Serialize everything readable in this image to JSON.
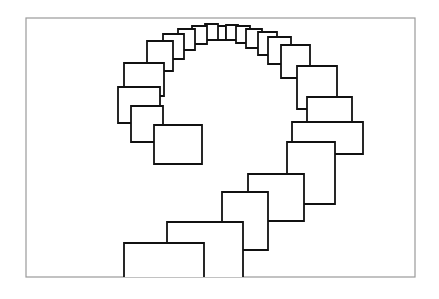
{
  "figure": {
    "caption": "",
    "background_color": "#ffffff",
    "stroke_color": "#111111",
    "fill_color": "#ffffff",
    "frame_color": "#9a9a9a",
    "frame": {
      "x": 26,
      "y": 18,
      "width": 389,
      "height": 259,
      "stroke_width": 1.2
    },
    "canvas": {
      "width": 439,
      "height": 299
    }
  },
  "chart_data": {
    "type": "diagram",
    "xlabel": "",
    "ylabel": "",
    "grid": false,
    "legend": "none",
    "xlim": [
      0,
      439
    ],
    "ylim": [
      0,
      299
    ],
    "shape": "rectangle",
    "count": 22,
    "stroke_width_px": 1.8,
    "rectangles": [
      {
        "index": 1,
        "x": 215,
        "y": 26,
        "width": 11,
        "height": 14,
        "clip_bottom": false
      },
      {
        "index": 2,
        "x": 226,
        "y": 25,
        "width": 12,
        "height": 15,
        "clip_bottom": false
      },
      {
        "index": 3,
        "x": 205,
        "y": 24,
        "width": 13,
        "height": 16,
        "clip_bottom": false
      },
      {
        "index": 4,
        "x": 236,
        "y": 26,
        "width": 14,
        "height": 17,
        "clip_bottom": false
      },
      {
        "index": 5,
        "x": 192,
        "y": 26,
        "width": 15,
        "height": 18,
        "clip_bottom": false
      },
      {
        "index": 6,
        "x": 246,
        "y": 29,
        "width": 16,
        "height": 19,
        "clip_bottom": false
      },
      {
        "index": 7,
        "x": 178,
        "y": 29,
        "width": 17,
        "height": 21,
        "clip_bottom": false
      },
      {
        "index": 8,
        "x": 258,
        "y": 32,
        "width": 19,
        "height": 23,
        "clip_bottom": false
      },
      {
        "index": 9,
        "x": 163,
        "y": 34,
        "width": 21,
        "height": 25,
        "clip_bottom": false
      },
      {
        "index": 10,
        "x": 268,
        "y": 37,
        "width": 23,
        "height": 27,
        "clip_bottom": false
      },
      {
        "index": 11,
        "x": 147,
        "y": 41,
        "width": 26,
        "height": 30,
        "clip_bottom": false
      },
      {
        "index": 12,
        "x": 281,
        "y": 45,
        "width": 29,
        "height": 33,
        "clip_bottom": false
      },
      {
        "index": 13,
        "x": 124,
        "y": 63,
        "width": 40,
        "height": 33,
        "clip_bottom": false
      },
      {
        "index": 14,
        "x": 297,
        "y": 66,
        "width": 40,
        "height": 43,
        "clip_bottom": false
      },
      {
        "index": 15,
        "x": 118,
        "y": 87,
        "width": 42,
        "height": 36,
        "clip_bottom": false
      },
      {
        "index": 16,
        "x": 307,
        "y": 97,
        "width": 45,
        "height": 27,
        "clip_bottom": false
      },
      {
        "index": 17,
        "x": 131,
        "y": 106,
        "width": 32,
        "height": 36,
        "clip_bottom": false
      },
      {
        "index": 18,
        "x": 292,
        "y": 122,
        "width": 71,
        "height": 32,
        "clip_bottom": false
      },
      {
        "index": 19,
        "x": 154,
        "y": 125,
        "width": 48,
        "height": 39,
        "clip_bottom": false
      },
      {
        "index": 20,
        "x": 287,
        "y": 142,
        "width": 48,
        "height": 62,
        "clip_bottom": false
      },
      {
        "index": 21,
        "x": 248,
        "y": 174,
        "width": 56,
        "height": 47,
        "clip_bottom": false
      },
      {
        "index": 22,
        "x": 222,
        "y": 192,
        "width": 46,
        "height": 58,
        "clip_bottom": false
      },
      {
        "index": 23,
        "x": 167,
        "y": 222,
        "width": 76,
        "height": 56,
        "clip_bottom": true
      },
      {
        "index": 24,
        "x": 124,
        "y": 243,
        "width": 80,
        "height": 36,
        "clip_bottom": true
      }
    ]
  }
}
